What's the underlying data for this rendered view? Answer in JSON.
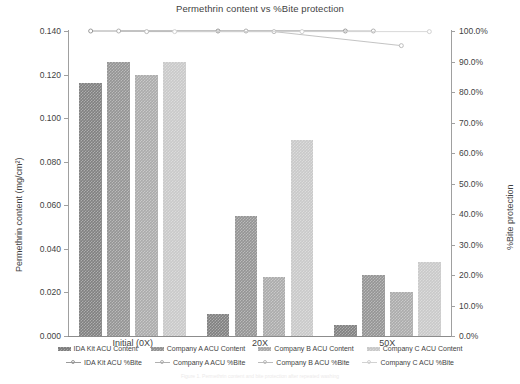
{
  "chart_data": {
    "type": "bar",
    "title": "Permethrin content vs %Bite protection",
    "xlabel": "",
    "ylabel": "Permethrin content (mg/cm²)",
    "ylabel_secondary": "%Bite protection",
    "categories": [
      "Initial (0X)",
      "20X",
      "50X"
    ],
    "ylim": [
      0,
      0.14
    ],
    "ylim_secondary": [
      0,
      1.0
    ],
    "ytick_labels": [
      "0.000",
      "0.020",
      "0.040",
      "0.060",
      "0.080",
      "0.100",
      "0.120",
      "0.140"
    ],
    "ytick_values": [
      0.0,
      0.02,
      0.04,
      0.06,
      0.08,
      0.1,
      0.12,
      0.14
    ],
    "ytick_labels_secondary": [
      "0.0%",
      "10.0%",
      "20.0%",
      "30.0%",
      "40.0%",
      "50.0%",
      "60.0%",
      "70.0%",
      "80.0%",
      "90.0%",
      "100.0%"
    ],
    "ytick_values_secondary": [
      0.0,
      0.1,
      0.2,
      0.3,
      0.4,
      0.5,
      0.6,
      0.7,
      0.8,
      0.9,
      1.0
    ],
    "grid": false,
    "legend_position": "bottom",
    "bar_series": [
      {
        "name": "IDA Kit ACU Content",
        "values": [
          0.116,
          0.01,
          0.005
        ],
        "color": "#808080"
      },
      {
        "name": "Company A ACU Content",
        "values": [
          0.126,
          0.055,
          0.028
        ],
        "color": "#949494"
      },
      {
        "name": "Company B ACU Content",
        "values": [
          0.12,
          0.027,
          0.02
        ],
        "color": "#ababab"
      },
      {
        "name": "Company C ACU Content",
        "values": [
          0.126,
          0.09,
          0.034
        ],
        "color": "#c9c9c9"
      }
    ],
    "line_series": [
      {
        "name": "IDA Kit ACU %Bite",
        "values": [
          1.0,
          1.0,
          1.0
        ],
        "color": "#9a9a9a"
      },
      {
        "name": "Company A ACU %Bite",
        "values": [
          1.0,
          1.0,
          1.0
        ],
        "color": "#b0b0b0"
      },
      {
        "name": "Company B ACU %Bite",
        "values": [
          0.998,
          0.998,
          0.952
        ],
        "color": "#bcbcbc"
      },
      {
        "name": "Company C ACU %Bite",
        "values": [
          0.998,
          0.998,
          0.998
        ],
        "color": "#d2d2d2"
      }
    ]
  },
  "footnote": "Figure 1. Permethrin content and bite protection after repeated washing"
}
